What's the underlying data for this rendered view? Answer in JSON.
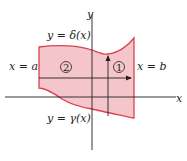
{
  "diagram": {
    "axes": {
      "x_label": "x",
      "y_label": "y"
    },
    "curves": {
      "top": "y = δ(x)",
      "bottom": "y = γ(x)",
      "left": "x = a",
      "right": "x = b"
    },
    "regions": [
      {
        "id": "1",
        "label": "1"
      },
      {
        "id": "2",
        "label": "2"
      }
    ],
    "colors": {
      "fill": "#f4c6cc",
      "boundary": "#d9434f",
      "axis": "#231f20",
      "arrow": "#231f20"
    }
  }
}
